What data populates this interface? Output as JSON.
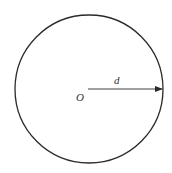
{
  "diagram": {
    "center_label": "O",
    "radius_label": "d",
    "stroke_color": "#2a2a2a"
  }
}
